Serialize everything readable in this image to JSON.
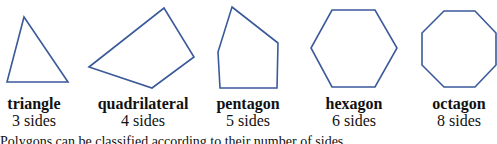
{
  "stroke_color": "#3a5a9a",
  "shapes": [
    {
      "name": "triangle",
      "sides_label": "3 sides",
      "points": "24,17 68,82 7,82",
      "label_center_x": 34
    },
    {
      "name": "quadrilateral",
      "sides_label": "4 sides",
      "points": "89,67 164,8 194,57 152,88",
      "label_center_x": 143
    },
    {
      "name": "pentagon",
      "sides_label": "5 sides",
      "points": "232,7 278,43 277,88 220,88 218,52",
      "label_center_x": 248
    },
    {
      "name": "hexagon",
      "sides_label": "6 sides",
      "points": "332,10 375,10 397,48 375,87 332,87 311,48",
      "label_center_x": 354
    },
    {
      "name": "octagon",
      "sides_label": "8 sides",
      "points": "444,11 475,11 496,33 496,65 475,87 444,87 422,65 422,33",
      "label_center_x": 459
    }
  ],
  "caption": "Polygons can be classified according to their number of sides."
}
